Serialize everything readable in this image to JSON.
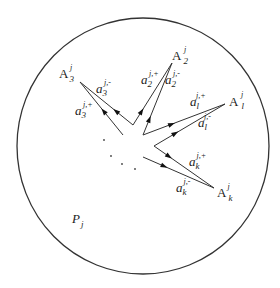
{
  "diagram": {
    "region_label": {
      "base": "P",
      "sub": "j"
    },
    "vertices": [
      {
        "id": "A3",
        "base": "A",
        "sub": "3",
        "sup": "j"
      },
      {
        "id": "A2",
        "base": "A",
        "sub": "2",
        "sup": "j"
      },
      {
        "id": "A1",
        "base": "A",
        "sub": "l",
        "sup": "j"
      },
      {
        "id": "Ak",
        "base": "A",
        "sub": "k",
        "sup": "j"
      }
    ],
    "edges": [
      {
        "id": "a3plus",
        "base": "a",
        "sub": "3",
        "sup": "j,+"
      },
      {
        "id": "a3minus",
        "base": "a",
        "sub": "3",
        "sup": "j,-"
      },
      {
        "id": "a2plus",
        "base": "a",
        "sub": "2",
        "sup": "j,+"
      },
      {
        "id": "a2minus",
        "base": "a",
        "sub": "2",
        "sup": "j,-"
      },
      {
        "id": "a1plus",
        "base": "a",
        "sub": "l",
        "sup": "j,+"
      },
      {
        "id": "a1minus",
        "base": "a",
        "sub": "l",
        "sup": "j,-"
      },
      {
        "id": "akplus",
        "base": "a",
        "sub": "k",
        "sup": "j,+"
      },
      {
        "id": "akminus",
        "base": "a",
        "sub": "k",
        "sup": "j,-"
      }
    ],
    "ellipsis": "· · · ·"
  }
}
